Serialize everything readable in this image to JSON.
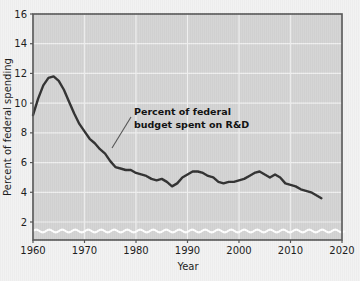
{
  "chart_data": {
    "type": "line",
    "title": "",
    "xlabel": "Year",
    "ylabel": "Percent of federal spending",
    "xlim": [
      1960,
      2020
    ],
    "ylim": [
      0,
      16
    ],
    "y_axis_break": true,
    "grid": true,
    "legend": null,
    "xticks": [
      1960,
      1970,
      1980,
      1990,
      2000,
      2010,
      2020
    ],
    "xtick_labels": [
      "1960",
      "1970",
      "1980",
      "1990",
      "2000",
      "2010",
      "2020"
    ],
    "yticks": [
      2,
      4,
      6,
      8,
      10,
      12,
      14,
      16
    ],
    "ytick_labels": [
      "2",
      "4",
      "6",
      "8",
      "10",
      "12",
      "14",
      "16"
    ],
    "series": [
      {
        "name": "Percent of federal budget spent on R&D",
        "color": "#333333",
        "x": [
          1960,
          1961,
          1962,
          1963,
          1964,
          1965,
          1966,
          1967,
          1968,
          1969,
          1970,
          1971,
          1972,
          1973,
          1974,
          1975,
          1976,
          1977,
          1978,
          1979,
          1980,
          1981,
          1982,
          1983,
          1984,
          1985,
          1986,
          1987,
          1988,
          1989,
          1990,
          1991,
          1992,
          1993,
          1994,
          1995,
          1996,
          1997,
          1998,
          1999,
          2000,
          2001,
          2002,
          2003,
          2004,
          2005,
          2006,
          2007,
          2008,
          2009,
          2010,
          2011,
          2012,
          2013,
          2014,
          2015,
          2016
        ],
        "values": [
          9.2,
          10.3,
          11.2,
          11.7,
          11.8,
          11.5,
          10.9,
          10.1,
          9.3,
          8.6,
          8.1,
          7.6,
          7.3,
          6.9,
          6.6,
          6.1,
          5.7,
          5.6,
          5.5,
          5.5,
          5.3,
          5.2,
          5.1,
          4.9,
          4.8,
          4.9,
          4.7,
          4.4,
          4.6,
          5.0,
          5.2,
          5.4,
          5.4,
          5.3,
          5.1,
          5.0,
          4.7,
          4.6,
          4.7,
          4.7,
          4.8,
          4.9,
          5.1,
          5.3,
          5.4,
          5.2,
          5.0,
          5.2,
          5.0,
          4.6,
          4.5,
          4.4,
          4.2,
          4.1,
          4.0,
          3.8,
          3.6
        ],
        "annotation": "Percent of federal budget spent on R&D"
      }
    ],
    "annotations": [
      {
        "name": "series-callout",
        "line1": "Percent of federal",
        "line2": "budget spent on R&D",
        "points_to_x": 1974,
        "points_to_y": 6.6
      }
    ],
    "colors": {
      "plot_background": "#d4d4d4",
      "figure_background": "#f2f2f2",
      "gridline": "#f0f0f0",
      "axis_frame": "#555555",
      "data_line": "#333333",
      "break_wave": "#ffffff",
      "text": "#1c1c1c"
    }
  }
}
